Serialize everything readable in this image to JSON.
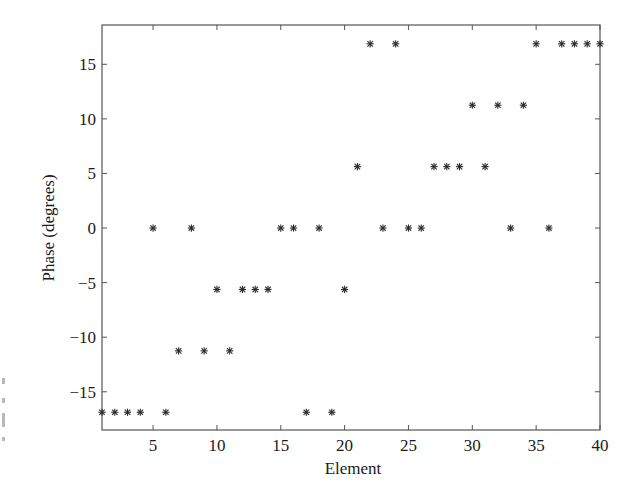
{
  "chart_data": {
    "type": "scatter",
    "title": "",
    "xlabel": "Element",
    "ylabel": "Phase (degrees)",
    "xlim": [
      1,
      40
    ],
    "ylim": [
      -18.5,
      18.6
    ],
    "xticks": [
      5,
      10,
      15,
      20,
      25,
      30,
      35,
      40
    ],
    "yticks": [
      -15,
      -10,
      -5,
      0,
      5,
      10,
      15
    ],
    "xtick_labels": [
      "5",
      "10",
      "15",
      "20",
      "25",
      "30",
      "35",
      "40"
    ],
    "ytick_labels": [
      "−15",
      "−10",
      "−5",
      "0",
      "5",
      "10",
      "15"
    ],
    "grid": false,
    "legend": null,
    "marker": "asterisk",
    "marker_color": "#2a2a2a",
    "series": [
      {
        "name": "Phase",
        "x": [
          1,
          2,
          3,
          4,
          5,
          6,
          7,
          8,
          9,
          10,
          11,
          12,
          13,
          14,
          15,
          16,
          17,
          18,
          19,
          20,
          21,
          22,
          23,
          24,
          25,
          26,
          27,
          28,
          29,
          30,
          31,
          32,
          33,
          34,
          35,
          36,
          37,
          38,
          39,
          40
        ],
        "y": [
          -16.875,
          -16.875,
          -16.875,
          -16.875,
          0,
          -16.875,
          -11.25,
          0,
          -11.25,
          -5.625,
          -11.25,
          -5.625,
          -5.625,
          -5.625,
          0,
          0,
          -16.875,
          0,
          -16.875,
          -5.625,
          5.625,
          16.875,
          0,
          16.875,
          0,
          0,
          5.625,
          5.625,
          5.625,
          11.25,
          5.625,
          11.25,
          0,
          11.25,
          16.875,
          0,
          16.875,
          16.875,
          16.875,
          16.875
        ]
      }
    ]
  },
  "labels": {
    "xlabel": "Element",
    "ylabel": "Phase (degrees)"
  }
}
